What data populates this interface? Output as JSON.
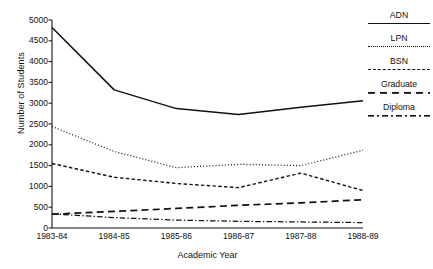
{
  "chart_data": {
    "type": "line",
    "title": "",
    "xlabel": "Academic Year",
    "ylabel": "Number of Students",
    "categories": [
      "1983-84",
      "1984-85",
      "1985-86",
      "1986-87",
      "1987-88",
      "1988-89"
    ],
    "ylim": [
      0,
      5000
    ],
    "yticks": [
      0,
      500,
      1000,
      1500,
      2000,
      2500,
      3000,
      3500,
      4000,
      4500,
      5000
    ],
    "grid": false,
    "legend_position": "right",
    "series": [
      {
        "name": "ADN",
        "style": "solid",
        "values": [
          4820,
          3320,
          2870,
          2730,
          2900,
          3060
        ]
      },
      {
        "name": "LPN",
        "style": "dotted",
        "values": [
          2440,
          1840,
          1450,
          1530,
          1500,
          1870
        ]
      },
      {
        "name": "BSN",
        "style": "dashed",
        "values": [
          1550,
          1220,
          1070,
          970,
          1320,
          900
        ]
      },
      {
        "name": "Graduate",
        "style": "longdash",
        "values": [
          330,
          400,
          470,
          545,
          605,
          680
        ]
      },
      {
        "name": "Diploma",
        "style": "dashdot",
        "values": [
          340,
          250,
          190,
          160,
          145,
          130
        ]
      }
    ]
  },
  "legend": {
    "items": [
      {
        "label": "ADN"
      },
      {
        "label": "LPN"
      },
      {
        "label": "BSN"
      },
      {
        "label": "Graduate"
      },
      {
        "label": "Diploma"
      }
    ]
  },
  "axes": {
    "y_title": "Number of Students",
    "x_title": "Academic Year",
    "y_tick_labels": [
      "5000",
      "4500",
      "4000",
      "3500",
      "3000",
      "2500",
      "2000",
      "1500",
      "1000",
      "500",
      "0"
    ],
    "x_tick_labels": [
      "1983-84",
      "1984-85",
      "1985-86",
      "1986-87",
      "1987-88",
      "1988-89"
    ]
  },
  "colors": {
    "ink": "#111111",
    "background": "#ffffff"
  }
}
